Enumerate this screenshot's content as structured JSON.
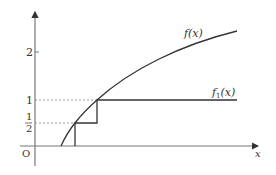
{
  "diagram": {
    "type": "function-graph",
    "axes": {
      "x_label": "x",
      "origin_label": "O",
      "y_ticks": [
        {
          "label": "2",
          "value": 2
        },
        {
          "label": "1",
          "value": 1
        },
        {
          "label_num": "1",
          "label_den": "2",
          "value": 0.5
        }
      ]
    },
    "curves": [
      {
        "name": "f",
        "label": "f(x)",
        "style": "smooth increasing concave"
      },
      {
        "name": "f1",
        "label_base": "f",
        "label_sub": "1",
        "label_arg": "(x)",
        "style": "step function"
      }
    ],
    "guides": [
      {
        "type": "dashed",
        "level": 1
      },
      {
        "type": "dashed",
        "level": 0.5
      }
    ],
    "colors": {
      "stroke": "#333333",
      "axis": "#777777",
      "dashed": "#888888"
    }
  }
}
